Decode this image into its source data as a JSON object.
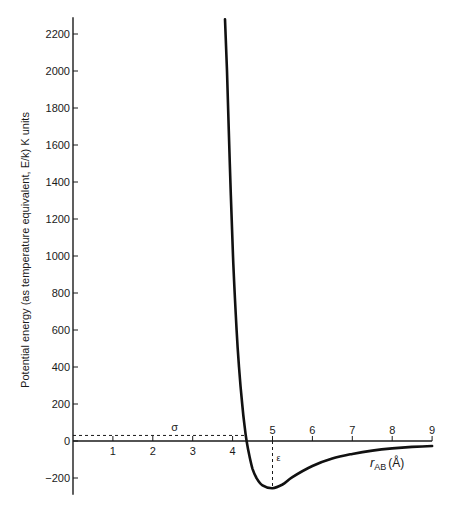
{
  "chart_data": {
    "type": "line",
    "title": "",
    "xlabel": "r_AB (Å)",
    "xlabel_main": "r",
    "xlabel_sub": "AB",
    "xlabel_unit": "(Å)",
    "ylabel": "Potential energy (as temperature equivalent, E/k) K units",
    "xlim": [
      0,
      9
    ],
    "ylim": [
      -280,
      2280
    ],
    "x_ticks": [
      1,
      2,
      3,
      4,
      5,
      6,
      7,
      8,
      9
    ],
    "y_ticks": [
      -200,
      0,
      200,
      400,
      600,
      800,
      1000,
      1200,
      1400,
      1600,
      1800,
      2000,
      2200
    ],
    "grid": false,
    "legend": null,
    "series": [
      {
        "name": "Lennard-Jones potential",
        "x": [
          3.81,
          3.86,
          3.93,
          4.01,
          4.1,
          4.16,
          4.24,
          4.3,
          4.35,
          4.42,
          4.5,
          4.6,
          4.75,
          5.0,
          5.25,
          5.5,
          6.0,
          6.5,
          7.0,
          7.5,
          8.0,
          8.5,
          9.0
        ],
        "values": [
          2280,
          2000,
          1500,
          1000,
          600,
          400,
          200,
          80,
          0,
          -80,
          -150,
          -200,
          -240,
          -255,
          -235,
          -195,
          -135,
          -95,
          -70,
          -52,
          -40,
          -32,
          -27
        ]
      }
    ],
    "annotations": [
      {
        "label": "σ",
        "description": "dashed horizontal line from y-axis to zero crossing",
        "x_end": 4.35,
        "y": 30
      },
      {
        "label": "ε",
        "description": "dashed vertical line from x-axis to minimum",
        "x": 5.0,
        "y_end": -255
      }
    ]
  },
  "plot": {
    "origin_px": [
      73,
      441
    ],
    "px_per_x": 39.9,
    "px_per_y": 0.185
  }
}
